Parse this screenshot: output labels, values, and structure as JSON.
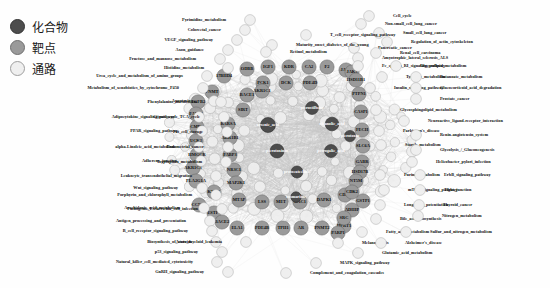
{
  "figure": {
    "type": "network-graph",
    "title": ""
  },
  "legend": {
    "items": [
      {
        "label": "化合物",
        "meaning": "compound",
        "color": "#4d4d4d",
        "stroke": "#333333"
      },
      {
        "label": "靶点",
        "meaning": "target",
        "color": "#9a9a9a",
        "stroke": "#6f6f6f"
      },
      {
        "label": "通路",
        "meaning": "pathway",
        "color": "#efefef",
        "stroke": "#9e9e9e"
      }
    ]
  },
  "colors": {
    "compound": "#4d4d4d",
    "compound_stroke": "#2f2f2f",
    "target": "#9a9a9a",
    "target_stroke": "#6d6d6d",
    "pathway": "#efefef",
    "pathway_stroke": "#a4a4a4",
    "edge": "#c9c9c9",
    "background": "#ffffff",
    "text": "#101010"
  },
  "chart_data": {
    "type": "network",
    "node_classes": [
      "compound",
      "target",
      "pathway"
    ],
    "counts": {
      "compounds": 8,
      "targets": 52,
      "pathways": 63
    },
    "compounds": [
      {
        "label": "arsenic_acid",
        "x": 268,
        "y": 125,
        "r": 7.5
      },
      {
        "label": "pterostilbene",
        "x": 312,
        "y": 108,
        "r": 6.5
      },
      {
        "label": "picrotoxinin",
        "x": 277,
        "y": 151,
        "r": 7.0
      },
      {
        "label": "oleanolic_acid",
        "x": 332,
        "y": 124,
        "r": 6.8
      },
      {
        "label": "petrogalic_acid",
        "x": 331,
        "y": 151,
        "r": 6.5
      },
      {
        "label": "protocatechuic",
        "x": 297,
        "y": 172,
        "r": 6.0
      },
      {
        "label": "picrotoxin",
        "x": 350,
        "y": 136,
        "r": 5.6
      },
      {
        "label": "rosmarinic",
        "x": 296,
        "y": 197,
        "r": 5.2
      }
    ],
    "targets": [
      {
        "label": "ODBB",
        "x": 247,
        "y": 69
      },
      {
        "label": "IGF1",
        "x": 268,
        "y": 67
      },
      {
        "label": "KDR",
        "x": 289,
        "y": 67
      },
      {
        "label": "CA2",
        "x": 309,
        "y": 67
      },
      {
        "label": "F2",
        "x": 327,
        "y": 67
      },
      {
        "label": "JAK2",
        "x": 346,
        "y": 70
      },
      {
        "label": "17BHD4",
        "x": 224,
        "y": 76
      },
      {
        "label": "PCK1",
        "x": 263,
        "y": 83
      },
      {
        "label": "DCK",
        "x": 286,
        "y": 83
      },
      {
        "label": "PDE4D",
        "x": 310,
        "y": 83
      },
      {
        "label": "PNMT",
        "x": 212,
        "y": 92
      },
      {
        "label": "BACE1",
        "x": 247,
        "y": 95
      },
      {
        "label": "TGFB2",
        "x": 198,
        "y": 102
      },
      {
        "label": "AKR1C1",
        "x": 262,
        "y": 91
      },
      {
        "label": "FABP2",
        "x": 196,
        "y": 114
      },
      {
        "label": "SIRT",
        "x": 243,
        "y": 110
      },
      {
        "label": "RARSA",
        "x": 228,
        "y": 124
      },
      {
        "label": "CMPK",
        "x": 197,
        "y": 127
      },
      {
        "label": "AKR1B1",
        "x": 230,
        "y": 138
      },
      {
        "label": "UCK2",
        "x": 196,
        "y": 141
      },
      {
        "label": "HMGCR",
        "x": 197,
        "y": 155
      },
      {
        "label": "FABP3",
        "x": 230,
        "y": 155
      },
      {
        "label": "AKR1C3",
        "x": 193,
        "y": 168
      },
      {
        "label": "PLA2G1A",
        "x": 196,
        "y": 181
      },
      {
        "label": "NR3C1",
        "x": 234,
        "y": 170
      },
      {
        "label": "MAP2K1",
        "x": 236,
        "y": 183
      },
      {
        "label": "KYNA",
        "x": 214,
        "y": 192
      },
      {
        "label": "MTAP",
        "x": 239,
        "y": 200
      },
      {
        "label": "LSS",
        "x": 262,
        "y": 202
      },
      {
        "label": "MET",
        "x": 281,
        "y": 202
      },
      {
        "label": "RAC1",
        "x": 300,
        "y": 202
      },
      {
        "label": "DAPK1",
        "x": 324,
        "y": 200
      },
      {
        "label": "CDK6",
        "x": 345,
        "y": 195
      },
      {
        "label": "CCNA2",
        "x": 199,
        "y": 205
      },
      {
        "label": "ESTP1",
        "x": 214,
        "y": 213
      },
      {
        "label": "BACE2",
        "x": 222,
        "y": 222
      },
      {
        "label": "ELA1",
        "x": 237,
        "y": 228
      },
      {
        "label": "PDE4B",
        "x": 262,
        "y": 228
      },
      {
        "label": "TPH1",
        "x": 283,
        "y": 228
      },
      {
        "label": "AR",
        "x": 301,
        "y": 228
      },
      {
        "label": "PNMT2",
        "x": 322,
        "y": 228
      },
      {
        "label": "HPRT1",
        "x": 344,
        "y": 226
      },
      {
        "label": "JAK3",
        "x": 352,
        "y": 72
      },
      {
        "label": "HSD11B1",
        "x": 356,
        "y": 80
      },
      {
        "label": "PTPN1",
        "x": 359,
        "y": 94
      },
      {
        "label": "CASP1",
        "x": 361,
        "y": 112
      },
      {
        "label": "FECH",
        "x": 362,
        "y": 130
      },
      {
        "label": "SLC6A",
        "x": 363,
        "y": 146
      },
      {
        "label": "GABR",
        "x": 362,
        "y": 162
      },
      {
        "label": "HSD17B",
        "x": 360,
        "y": 172
      },
      {
        "label": "NT5M",
        "x": 356,
        "y": 181
      },
      {
        "label": "CDK2",
        "x": 352,
        "y": 192
      },
      {
        "label": "ADHIP",
        "x": 352,
        "y": 210
      },
      {
        "label": "SRC",
        "x": 344,
        "y": 218
      },
      {
        "label": "PARP1",
        "x": 338,
        "y": 233
      },
      {
        "label": "GSTP1",
        "x": 363,
        "y": 201
      }
    ],
    "pathways_left": [
      {
        "label": "Pyrimidine_metabolism",
        "x": 226,
        "y": 20
      },
      {
        "label": "Colorectal_cancer",
        "x": 221,
        "y": 30
      },
      {
        "label": "VEGF_signaling_pathway",
        "x": 213,
        "y": 40
      },
      {
        "label": "Axon_guidance",
        "x": 204,
        "y": 50
      },
      {
        "label": "Fructose_and_mannose_metabolism",
        "x": 196,
        "y": 59
      },
      {
        "label": "Histidine_metabolism",
        "x": 204,
        "y": 68
      },
      {
        "label": "Urea_cycle_and_metabolism_of_amino_groups",
        "x": 183,
        "y": 76
      },
      {
        "label": "Metabolism_of_xenobiotics_by_cytochrome_P450",
        "x": 179,
        "y": 88
      },
      {
        "label": "Apoptosis",
        "x": 190,
        "y": 101
      },
      {
        "label": "Phenylalanine_metabolism",
        "x": 197,
        "y": 102
      },
      {
        "label": "Adipocytokine_signaling_pathway",
        "x": 175,
        "y": 117
      },
      {
        "label": "Citrate_cycle_TCA_cycle",
        "x": 200,
        "y": 117
      },
      {
        "label": "PPAR_signaling_pathway",
        "x": 178,
        "y": 131
      },
      {
        "label": "Fat_cell_storage",
        "x": 203,
        "y": 132
      },
      {
        "label": "alpha-Linoleic_acid_metabolism",
        "x": 175,
        "y": 147
      },
      {
        "label": "Endometrial_cancer",
        "x": 204,
        "y": 147
      },
      {
        "label": "Adherens_junction",
        "x": 177,
        "y": 161
      },
      {
        "label": "Tryptophan_metabolism",
        "x": 202,
        "y": 162
      },
      {
        "label": "Leukocyte_transendothelial_migration",
        "x": 192,
        "y": 176
      },
      {
        "label": "Wnt_signaling_pathway",
        "x": 178,
        "y": 188
      },
      {
        "label": "Porphyrin_and_chlorophyll_metabolism",
        "x": 192,
        "y": 195
      },
      {
        "label": "Arachidonic_acid_metabolism",
        "x": 180,
        "y": 208
      },
      {
        "label": "Pathogenic_Escherichia_coli_infection",
        "x": 198,
        "y": 209
      },
      {
        "label": "Antigen_processing_and_presentation",
        "x": 186,
        "y": 221
      },
      {
        "label": "B_cell_receptor_signaling_pathway",
        "x": 188,
        "y": 231
      },
      {
        "label": "Biosynthesis_of_steroids",
        "x": 192,
        "y": 242
      },
      {
        "label": "Acute_myeloid_leukemia",
        "x": 222,
        "y": 242
      },
      {
        "label": "p53_signaling_pathway",
        "x": 198,
        "y": 252
      },
      {
        "label": "Natural_killer_cell_mediated_cytotoxicity",
        "x": 193,
        "y": 262
      },
      {
        "label": "GnRH_signaling_pathway",
        "x": 204,
        "y": 272
      }
    ],
    "pathways_right": [
      {
        "label": "Cell_cycle",
        "x": 393,
        "y": 16
      },
      {
        "label": "Non-small_cell_lung_cancer",
        "x": 385,
        "y": 24
      },
      {
        "label": "Small_cell_lung_cancer",
        "x": 403,
        "y": 33
      },
      {
        "label": "Regulation_of_actin_cytoskeleton",
        "x": 411,
        "y": 42
      },
      {
        "label": "Pancreatic_cancer",
        "x": 378,
        "y": 48
      },
      {
        "label": "Renal_cell_carcinoma",
        "x": 400,
        "y": 53
      },
      {
        "label": "T_cell_receptor_signaling_pathway",
        "x": 330,
        "y": 35
      },
      {
        "label": "Maturity_onset_diabetes_of_the_young",
        "x": 296,
        "y": 45
      },
      {
        "label": "Retinol_metabolism",
        "x": 290,
        "y": 52
      },
      {
        "label": "Amyotrophic_lateral_sclerosis_ALS",
        "x": 382,
        "y": 58
      },
      {
        "label": "Fc_epsilon_RI_signaling_pathway",
        "x": 382,
        "y": 66
      },
      {
        "label": "Glycerolipid_metabolism",
        "x": 420,
        "y": 66
      },
      {
        "label": "Tyrosine_metabolism",
        "x": 406,
        "y": 77
      },
      {
        "label": "Butanoate_metabolism",
        "x": 440,
        "y": 77
      },
      {
        "label": "Insulin_signaling_pathway",
        "x": 394,
        "y": 88
      },
      {
        "label": "Glucocorticoid_acid_degradation",
        "x": 440,
        "y": 88
      },
      {
        "label": "Prostate_cancer",
        "x": 440,
        "y": 99
      },
      {
        "label": "Glycosphingolipid_metabolism",
        "x": 400,
        "y": 110
      },
      {
        "label": "Neuroactive_ligand-receptor_interaction",
        "x": 428,
        "y": 121
      },
      {
        "label": "Parkinson's_disease",
        "x": 403,
        "y": 131
      },
      {
        "label": "Renin-angiotensin_system",
        "x": 440,
        "y": 135
      },
      {
        "label": "Starch_metabolism",
        "x": 405,
        "y": 145
      },
      {
        "label": "Glycolysis_/_Gluconeogenesis",
        "x": 440,
        "y": 150
      },
      {
        "label": "Helicobacter_pylori_infection",
        "x": 436,
        "y": 162
      },
      {
        "label": "Purine_metabolism",
        "x": 404,
        "y": 175
      },
      {
        "label": "ErbB_signaling_pathway",
        "x": 444,
        "y": 175
      },
      {
        "label": "mTOR_signaling_pathway",
        "x": 408,
        "y": 190
      },
      {
        "label": "Tight_junction",
        "x": 444,
        "y": 190
      },
      {
        "label": "Long-term_potentiation",
        "x": 404,
        "y": 205
      },
      {
        "label": "Thyroid_cancer",
        "x": 443,
        "y": 205
      },
      {
        "label": "Bile_acid_biosynthesis",
        "x": 400,
        "y": 219
      },
      {
        "label": "Nitrogen_metabolism",
        "x": 442,
        "y": 216
      },
      {
        "label": "Fatty_acid_metabolism",
        "x": 386,
        "y": 232
      },
      {
        "label": "Sulfur_and_nitrogen_metabolism",
        "x": 430,
        "y": 232
      },
      {
        "label": "Melanogenesis",
        "x": 362,
        "y": 243
      },
      {
        "label": "Alzheimer's_disease",
        "x": 405,
        "y": 243
      },
      {
        "label": "Glutamic_acid_metabolism",
        "x": 382,
        "y": 253
      },
      {
        "label": "MAPK_signaling_pathway",
        "x": 340,
        "y": 263
      },
      {
        "label": "Complement_and_coagulation_cascades",
        "x": 310,
        "y": 273
      }
    ]
  }
}
